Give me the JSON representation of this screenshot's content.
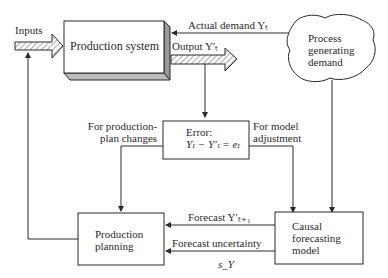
{
  "nodes": {
    "production_system": {
      "label": "Production system"
    },
    "process_generating_demand": {
      "line1": "Process",
      "line2": "generating",
      "line3": "demand"
    },
    "error": {
      "line1": "Error:",
      "line2": "Yₜ − Y′ₜ = eₜ"
    },
    "production_planning": {
      "line1": "Production",
      "line2": "planning"
    },
    "causal_forecasting_model": {
      "line1": "Causal",
      "line2": "forecasting",
      "line3": "model"
    }
  },
  "edges": {
    "inputs": "Inputs",
    "actual_demand": "Actual demand Yₜ",
    "output": "Output Y′ₜ",
    "for_production_plan_changes_1": "For production-",
    "for_production_plan_changes_2": "plan changes",
    "for_model_adjustment_1": "For model",
    "for_model_adjustment_2": "adjustment",
    "forecast": "Forecast Y′ₜ₊₁",
    "forecast_uncertainty": "Forecast uncertainty",
    "forecast_uncertainty_symbol": "s_Y"
  },
  "colors": {
    "line": "#2a2a2a",
    "hatch": "#555555",
    "box_shadow": "#bdbdbd"
  }
}
